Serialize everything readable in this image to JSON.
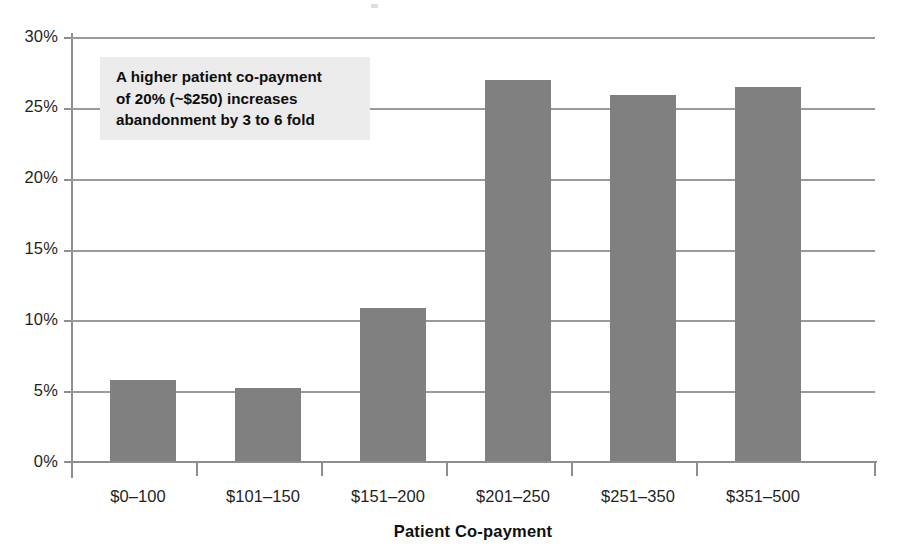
{
  "chart_data": {
    "type": "bar",
    "title": "",
    "subtitle": "",
    "xlabel": "Patient Co-payment",
    "ylabel": "",
    "categories": [
      "$0–100",
      "$101–150",
      "$151–200",
      "$201–250",
      "$251–350",
      "$351–500"
    ],
    "values": [
      5.8,
      5.2,
      10.9,
      27.0,
      25.9,
      26.5
    ],
    "value_unit": "%",
    "ylim": [
      0,
      30
    ],
    "ytick_values": [
      0,
      5,
      10,
      15,
      20,
      25,
      30
    ],
    "ytick_labels": [
      "0%",
      "5%",
      "10%",
      "15%",
      "20%",
      "25%",
      "30%"
    ],
    "grid": true,
    "grid_axis": "y",
    "legend": false,
    "legend_position": "none",
    "bar_color": "#808080",
    "gridline_color": "#9a9a9a",
    "axis_color": "#8e8e8e",
    "annotations": [
      {
        "id": "callout",
        "text": "A higher patient co-payment of 20% (~$250) increases abandonment by 3 to 6 fold",
        "lines": [
          "A higher patient co-payment",
          "of 20% (~$250) increases",
          "abandonment by 3 to 6 fold"
        ],
        "background_color": "#ebebeb",
        "text_color": "#0d0d0d"
      }
    ]
  },
  "axis": {
    "x_title": "Patient Co-payment"
  }
}
